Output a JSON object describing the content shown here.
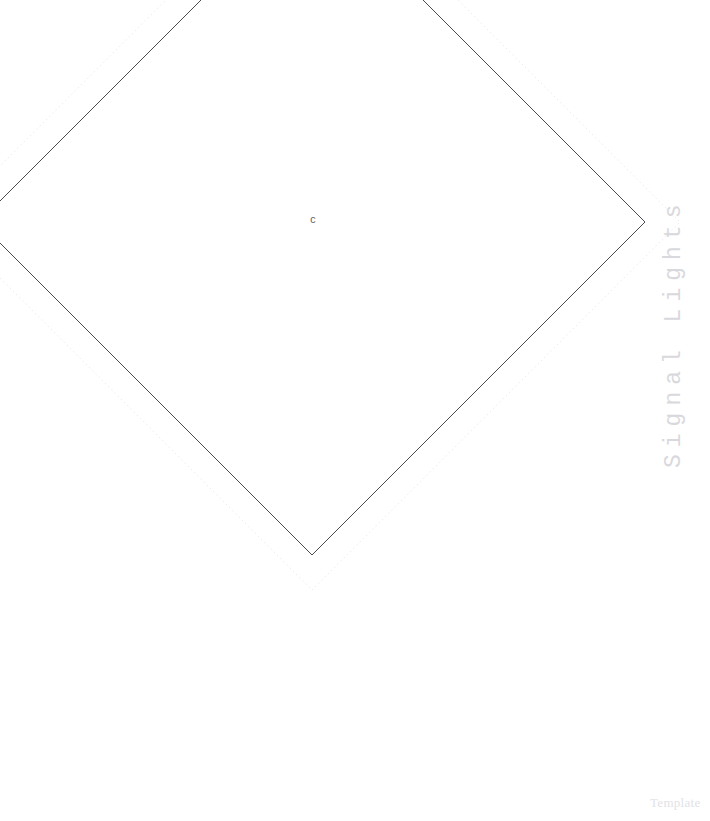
{
  "page": {
    "background_color": "#ffffff",
    "width": 710,
    "height": 821
  },
  "drawing": {
    "title_caption": "Signal Lights",
    "footer_caption": "Template",
    "center_label": "c",
    "solid_shape": {
      "name": "diamond-outline",
      "stroke_color": "#4a4a50",
      "stroke_width": 1,
      "fill": "none",
      "center_x": 312,
      "center_y": 222,
      "half_diagonal": 333,
      "vertices": [
        {
          "label": "top",
          "x": 312,
          "y": -111
        },
        {
          "label": "right",
          "x": 645,
          "y": 222
        },
        {
          "label": "bottom",
          "x": 312,
          "y": 555
        },
        {
          "label": "left",
          "x": -21,
          "y": 222
        }
      ]
    },
    "dotted_shape": {
      "name": "diamond-guide",
      "stroke_color": "#ececf0",
      "stroke_width": 1,
      "dash_pattern": "1.5 3",
      "fill": "none",
      "center_x": 312,
      "center_y": 222,
      "half_diagonal": 368,
      "vertices": [
        {
          "label": "top",
          "x": 312,
          "y": -146
        },
        {
          "label": "right",
          "x": 680,
          "y": 222
        },
        {
          "label": "bottom",
          "x": 312,
          "y": 590
        },
        {
          "label": "left",
          "x": -56,
          "y": 222
        }
      ]
    }
  },
  "colors": {
    "line_dark": "#4a4a50",
    "line_guide": "#ececf0",
    "caption_gray": "#d9d9dd",
    "footer_gray": "#e2e2e6",
    "label_gray": "#5a5a5f",
    "background": "#ffffff"
  }
}
